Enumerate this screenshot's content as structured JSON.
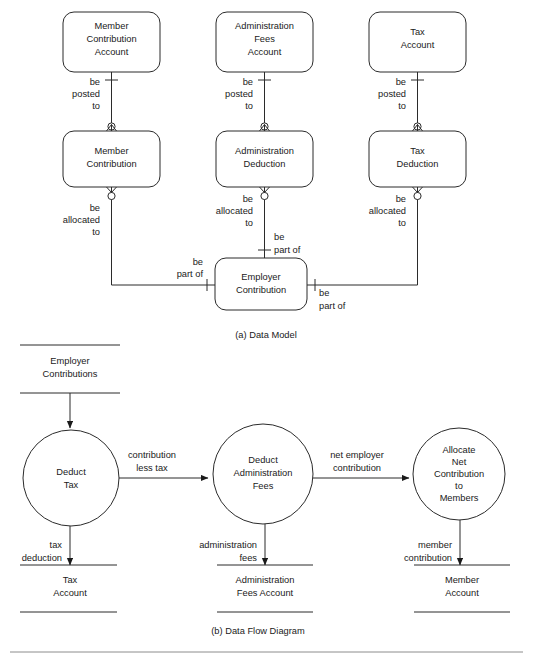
{
  "figure": {
    "data_model": {
      "caption": "(a) Data Model",
      "entities": [
        {
          "id": "member_contribution_account",
          "lines": [
            "Member",
            "Contribution",
            "Account"
          ]
        },
        {
          "id": "administration_fees_account",
          "lines": [
            "Administration",
            "Fees",
            "Account"
          ]
        },
        {
          "id": "tax_account",
          "lines": [
            "Tax",
            "Account"
          ]
        },
        {
          "id": "member_contribution",
          "lines": [
            "Member",
            "Contribution"
          ]
        },
        {
          "id": "administration_deduction",
          "lines": [
            "Administration",
            "Deduction"
          ]
        },
        {
          "id": "tax_deduction",
          "lines": [
            "Tax",
            "Deduction"
          ]
        },
        {
          "id": "employer_contribution",
          "lines": [
            "Employer",
            "Contribution"
          ]
        }
      ],
      "relationships": [
        {
          "id": "rel_member_posted_to",
          "lines": [
            "be",
            "posted",
            "to"
          ]
        },
        {
          "id": "rel_admin_posted_to",
          "lines": [
            "be",
            "posted",
            "to"
          ]
        },
        {
          "id": "rel_tax_posted_to",
          "lines": [
            "be",
            "posted",
            "to"
          ]
        },
        {
          "id": "rel_member_allocated_to",
          "lines": [
            "be",
            "allocated",
            "to"
          ]
        },
        {
          "id": "rel_admin_allocated_to",
          "lines": [
            "be",
            "allocated",
            "to"
          ]
        },
        {
          "id": "rel_tax_allocated_to",
          "lines": [
            "be",
            "allocated",
            "to"
          ]
        },
        {
          "id": "rel_admin_part_of",
          "lines": [
            "be",
            "part of"
          ]
        },
        {
          "id": "rel_member_part_of",
          "lines": [
            "be",
            "part of"
          ]
        },
        {
          "id": "rel_tax_part_of",
          "lines": [
            "be",
            "part of"
          ]
        }
      ]
    },
    "data_flow": {
      "caption": "(b) Data Flow Diagram",
      "processes": [
        {
          "id": "deduct_tax",
          "lines": [
            "Deduct",
            "Tax"
          ]
        },
        {
          "id": "deduct_administration_fees",
          "lines": [
            "Deduct",
            "Administration",
            "Fees"
          ]
        },
        {
          "id": "allocate_net_contribution",
          "lines": [
            "Allocate",
            "Net",
            "Contribution",
            "to",
            "Members"
          ]
        }
      ],
      "stores": [
        {
          "id": "employer_contributions_store",
          "lines": [
            "Employer",
            "Contributions"
          ]
        },
        {
          "id": "tax_account_store",
          "lines": [
            "Tax",
            "Account"
          ]
        },
        {
          "id": "administration_fees_account_store",
          "lines": [
            "Administration",
            "Fees Account"
          ]
        },
        {
          "id": "member_account_store",
          "lines": [
            "Member",
            "Account"
          ]
        }
      ],
      "flows": [
        {
          "id": "flow_contribution_less_tax",
          "lines": [
            "contribution",
            "less tax"
          ]
        },
        {
          "id": "flow_net_employer_contribution",
          "lines": [
            "net employer",
            "contribution"
          ]
        },
        {
          "id": "flow_tax_deduction",
          "lines": [
            "tax",
            "deduction"
          ]
        },
        {
          "id": "flow_administration_fees",
          "lines": [
            "administration",
            "fees"
          ]
        },
        {
          "id": "flow_member_contribution",
          "lines": [
            "member",
            "contribution"
          ]
        }
      ]
    },
    "colors": {
      "stroke": "#2b2b2b",
      "text": "#1a1a1a",
      "background": "#ffffff",
      "rule": "#8c8c8c"
    }
  }
}
